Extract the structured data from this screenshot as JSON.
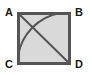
{
  "figure": {
    "colors": {
      "stroke": "#555555",
      "fill": "#d9d9d9",
      "label": "#1a1a1a",
      "background": "#ffffff"
    },
    "square": {
      "name": "ABDC",
      "left": 17,
      "top": 12,
      "right": 71,
      "bottom": 65,
      "side_px": 54,
      "stroke_width": 3
    },
    "labels": {
      "a": "A",
      "b": "B",
      "c": "C",
      "d": "D"
    },
    "elements": {
      "diagonal": {
        "name": "diagonal-A-to-D",
        "from": "A",
        "to": "D",
        "stroke_width": 2
      },
      "arc": {
        "name": "quarter-arc-centered-at-D",
        "center": "D",
        "from_edge": "top",
        "to_edge": "left",
        "radius_px": 54,
        "stroke_width": 2
      }
    }
  }
}
